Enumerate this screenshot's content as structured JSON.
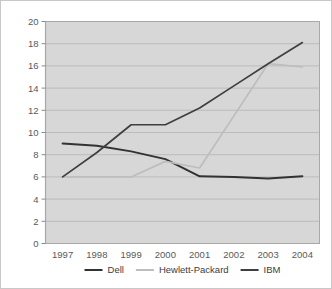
{
  "chart_data": {
    "type": "line",
    "title": "",
    "xlabel": "",
    "ylabel": "",
    "categories": [
      "1997",
      "1998",
      "1999",
      "2000",
      "2001",
      "2002",
      "2003",
      "2004"
    ],
    "ylim": [
      0,
      20
    ],
    "yticks": [
      0,
      2,
      4,
      6,
      8,
      10,
      12,
      14,
      16,
      18,
      20
    ],
    "grid": true,
    "legend_position": "bottom",
    "plot_background": "#d7d7d7",
    "series": [
      {
        "name": "Dell",
        "color": "#323234",
        "values": [
          9.0,
          8.8,
          8.3,
          7.6,
          6.05,
          6.0,
          5.85,
          6.05
        ]
      },
      {
        "name": "Hewlett-Packard",
        "color": "#bdbdbd",
        "values": [
          6.0,
          6.0,
          6.0,
          7.4,
          6.8,
          11.5,
          16.2,
          15.9
        ]
      },
      {
        "name": "IBM",
        "color": "#3f3f41",
        "values": [
          6.0,
          8.2,
          10.7,
          10.7,
          12.2,
          14.2,
          16.2,
          18.1
        ]
      }
    ]
  },
  "ytick_labels": [
    "0",
    "2",
    "4",
    "6",
    "8",
    "10",
    "12",
    "14",
    "16",
    "18",
    "20"
  ],
  "xtick_labels": [
    "1997",
    "1998",
    "1999",
    "2000",
    "2001",
    "2002",
    "2003",
    "2004"
  ],
  "legend": {
    "items": [
      {
        "label": "Dell",
        "color": "#323234"
      },
      {
        "label": "Hewlett-Packard",
        "color": "#bdbdbd"
      },
      {
        "label": "IBM",
        "color": "#3f3f41"
      }
    ]
  }
}
